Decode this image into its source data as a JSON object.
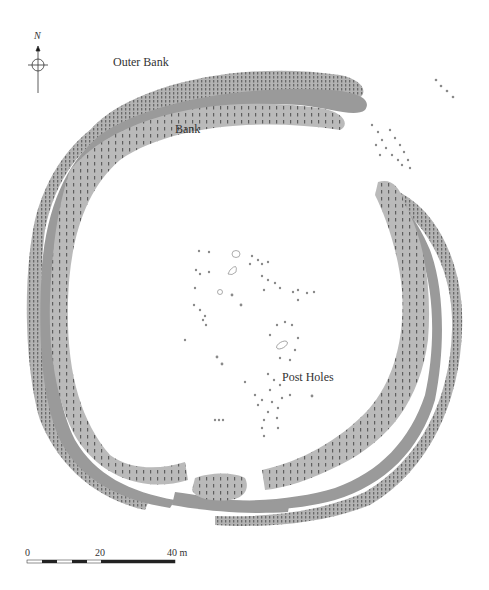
{
  "map": {
    "north_label": "N",
    "labels": {
      "outer_bank": "Outer Bank",
      "bank": "Bank",
      "post_holes": "Post Holes"
    },
    "scale_bar": {
      "ticks": [
        "0",
        "20",
        "40 m"
      ],
      "unit": "m",
      "length_m": 40
    },
    "colors": {
      "outer_bank": "#b3b3b3",
      "ditch": "#9a9a9a",
      "inner_bank": "#b8b8b8",
      "hachure": "#5a5a5a",
      "post_hole": "#8a8a8a",
      "background": "#ffffff"
    }
  }
}
